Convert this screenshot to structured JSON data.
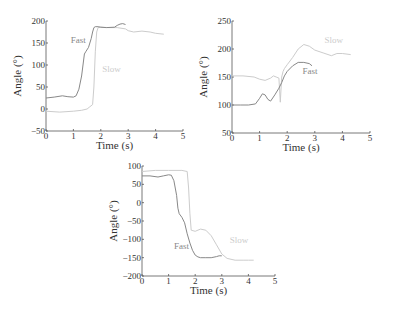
{
  "chart_data": [
    {
      "type": "line",
      "title": "",
      "xlabel": "Time (s)",
      "ylabel": "Angle (°)",
      "xlim": [
        0,
        5
      ],
      "ylim": [
        -50,
        200
      ],
      "xticks": [
        0,
        1,
        2,
        3,
        4,
        5
      ],
      "yticks": [
        -50,
        0,
        50,
        100,
        150,
        200
      ],
      "grid": false,
      "legend": "inline labels",
      "layout": {
        "x0": 46,
        "x1": 183,
        "ytop": 21,
        "ybot": 131
      },
      "annotations": [
        {
          "text": "Fast",
          "x": 0.9,
          "y": 150,
          "color": "#888888"
        },
        {
          "text": "Slow",
          "x": 2.05,
          "y": 85,
          "color": "#cccccc"
        }
      ],
      "series": [
        {
          "name": "Fast",
          "color": "#888888",
          "x": [
            0,
            0.3,
            0.6,
            0.8,
            1.0,
            1.1,
            1.2,
            1.3,
            1.4,
            1.45,
            1.55,
            1.65,
            1.7,
            1.75,
            1.8,
            1.9,
            2.0,
            2.2,
            2.5,
            2.6,
            2.7,
            2.8,
            2.9
          ],
          "y": [
            25,
            27,
            30,
            28,
            27,
            30,
            45,
            75,
            125,
            130,
            140,
            160,
            175,
            185,
            187,
            187,
            186,
            185,
            186,
            190,
            193,
            194,
            192
          ]
        },
        {
          "name": "Slow",
          "color": "#cccccc",
          "x": [
            0,
            0.5,
            1.0,
            1.3,
            1.5,
            1.6,
            1.7,
            1.75,
            1.8,
            1.85,
            1.9,
            2.0,
            2.3,
            2.6,
            2.9,
            3.0,
            3.2,
            3.5,
            3.8,
            4.0,
            4.3
          ],
          "y": [
            -5,
            -7,
            -5,
            -3,
            0,
            5,
            10,
            50,
            130,
            175,
            185,
            186,
            185,
            185,
            182,
            178,
            175,
            177,
            175,
            172,
            170
          ]
        }
      ]
    },
    {
      "type": "line",
      "title": "",
      "xlabel": "Time (s)",
      "ylabel": "Angle (°)",
      "xlim": [
        0,
        5
      ],
      "ylim": [
        50,
        250
      ],
      "xticks": [
        0,
        1,
        2,
        3,
        4,
        5
      ],
      "yticks": [
        50,
        100,
        150,
        200,
        250
      ],
      "grid": false,
      "legend": "inline labels",
      "layout": {
        "x0": 232,
        "x1": 370,
        "ytop": 21,
        "ybot": 133
      },
      "annotations": [
        {
          "text": "Fast",
          "x": 2.55,
          "y": 155,
          "color": "#888888"
        },
        {
          "text": "Slow",
          "x": 3.35,
          "y": 210,
          "color": "#cccccc"
        }
      ],
      "series": [
        {
          "name": "Fast",
          "color": "#888888",
          "x": [
            0,
            0.3,
            0.6,
            0.85,
            1.0,
            1.1,
            1.2,
            1.3,
            1.4,
            1.55,
            1.7,
            1.8,
            1.9,
            2.0,
            2.2,
            2.4,
            2.6,
            2.8,
            2.9
          ],
          "y": [
            100,
            100,
            100,
            102,
            112,
            120,
            118,
            110,
            107,
            118,
            130,
            140,
            152,
            160,
            170,
            176,
            176,
            174,
            170
          ]
        },
        {
          "name": "Slow",
          "color": "#cccccc",
          "x": [
            0,
            0.4,
            0.8,
            1.0,
            1.2,
            1.4,
            1.5,
            1.6,
            1.7,
            1.75,
            1.8,
            1.85,
            1.9,
            2.0,
            2.2,
            2.4,
            2.6,
            2.8,
            3.0,
            3.3,
            3.6,
            3.8,
            4.0,
            4.3
          ],
          "y": [
            152,
            152,
            150,
            146,
            144,
            148,
            152,
            150,
            148,
            105,
            150,
            160,
            165,
            172,
            185,
            200,
            208,
            205,
            198,
            193,
            188,
            192,
            192,
            190
          ]
        }
      ]
    },
    {
      "type": "line",
      "title": "",
      "xlabel": "Time (s)",
      "ylabel": "Angle (°)",
      "xlim": [
        0,
        5
      ],
      "ylim": [
        -200,
        100
      ],
      "xticks": [
        0,
        1,
        2,
        3,
        4,
        5
      ],
      "yticks": [
        -200,
        -150,
        -100,
        -50,
        0,
        50,
        100
      ],
      "grid": false,
      "legend": "inline labels",
      "layout": {
        "x0": 142,
        "x1": 275,
        "ytop": 166,
        "ybot": 276
      },
      "annotations": [
        {
          "text": "Fast",
          "x": 1.2,
          "y": -125,
          "color": "#888888"
        },
        {
          "text": "Slow",
          "x": 3.3,
          "y": -110,
          "color": "#cccccc"
        }
      ],
      "series": [
        {
          "name": "Fast",
          "color": "#888888",
          "x": [
            0,
            0.3,
            0.6,
            0.8,
            1.0,
            1.1,
            1.2,
            1.3,
            1.35,
            1.4,
            1.5,
            1.6,
            1.7,
            1.8,
            1.9,
            2.0,
            2.1,
            2.2,
            2.4,
            2.6,
            2.8,
            2.9,
            3.0
          ],
          "y": [
            73,
            73,
            70,
            73,
            76,
            75,
            60,
            20,
            -15,
            -30,
            -40,
            -55,
            -85,
            -110,
            -130,
            -143,
            -148,
            -150,
            -150,
            -150,
            -147,
            -145,
            -145
          ]
        },
        {
          "name": "Slow",
          "color": "#cccccc",
          "x": [
            0,
            0.5,
            1.0,
            1.5,
            1.7,
            1.75,
            1.8,
            1.85,
            2.0,
            2.2,
            2.4,
            2.6,
            2.8,
            3.0,
            3.2,
            3.5,
            3.8,
            4.0,
            4.2
          ],
          "y": [
            85,
            88,
            88,
            88,
            85,
            40,
            -30,
            -75,
            -78,
            -72,
            -75,
            -90,
            -115,
            -140,
            -152,
            -157,
            -157,
            -157,
            -157
          ]
        }
      ]
    }
  ]
}
